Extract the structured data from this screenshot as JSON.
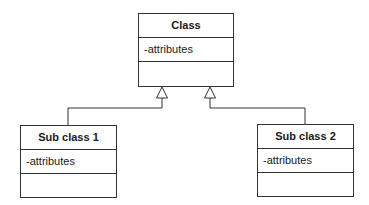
{
  "diagram": {
    "type": "uml-class-inheritance",
    "colors": {
      "line": "#333333",
      "background": "#ffffff",
      "text": "#1a1a1a"
    },
    "classes": [
      {
        "id": "class",
        "name": "Class",
        "attributes": "-attributes",
        "operations": "",
        "role": "superclass"
      },
      {
        "id": "sub-class-1",
        "name": "Sub class 1",
        "attributes": "-attributes",
        "operations": "",
        "role": "subclass"
      },
      {
        "id": "sub-class-2",
        "name": "Sub class 2",
        "attributes": "-attributes",
        "operations": "",
        "role": "subclass"
      }
    ],
    "relationships": [
      {
        "from": "Sub class 1",
        "to": "Class",
        "type": "generalization"
      },
      {
        "from": "Sub class 2",
        "to": "Class",
        "type": "generalization"
      }
    ]
  }
}
